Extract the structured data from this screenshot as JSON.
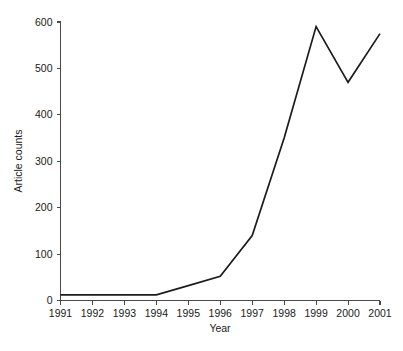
{
  "chart_data": {
    "type": "line",
    "title": "",
    "subtitle": "",
    "xlabel": "Year",
    "ylabel": "Article counts",
    "categories": [
      "1991",
      "1992",
      "1993",
      "1994",
      "1995",
      "1996",
      "1997",
      "1998",
      "1999",
      "2000",
      "2001"
    ],
    "x": [
      1991,
      1992,
      1993,
      1994,
      1995,
      1996,
      1997,
      1998,
      1999,
      2000,
      2001
    ],
    "values": [
      12,
      12,
      12,
      12,
      32,
      52,
      140,
      350,
      590,
      470,
      575
    ],
    "series": [
      {
        "name": "Article counts",
        "values": [
          12,
          12,
          12,
          12,
          32,
          52,
          140,
          350,
          590,
          470,
          575
        ]
      }
    ],
    "xlim": [
      1991,
      2001
    ],
    "ylim": [
      0,
      600
    ],
    "ytick_labels": [
      "0",
      "100",
      "200",
      "300",
      "400",
      "500",
      "600"
    ],
    "ytick_values": [
      0,
      100,
      200,
      300,
      400,
      500,
      600
    ],
    "xtick_labels": [
      "1991",
      "1992",
      "1993",
      "1994",
      "1995",
      "1996",
      "1997",
      "1998",
      "1999",
      "2000",
      "2001"
    ],
    "grid": false,
    "legend": false,
    "legend_position": "none",
    "markers": false,
    "line_color": "#1c1c1c",
    "axis_color": "#4a4a4a",
    "background_color": "#ffffff",
    "annotations": []
  },
  "axes": {
    "y_title": "Article counts",
    "x_title": "Year"
  }
}
